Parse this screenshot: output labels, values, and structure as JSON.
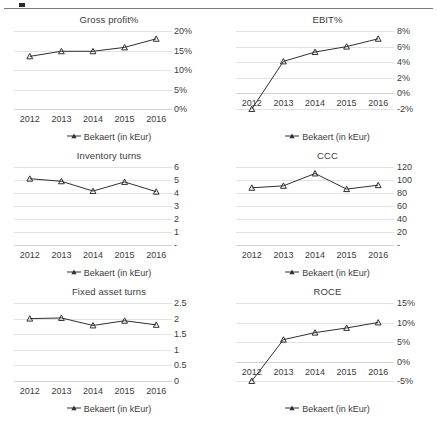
{
  "page": {
    "legend_label": "Bekaert  (in kEur)",
    "series_color": "#2f2f2f",
    "grid_color": "#e2e2e2",
    "text_color": "#3b3b3b"
  },
  "chart_data": [
    {
      "id": "gross-profit",
      "type": "line",
      "title": "Gross profit%",
      "xlabel": "",
      "ylabel": "",
      "categories": [
        "2012",
        "2013",
        "2014",
        "2015",
        "2016"
      ],
      "x": [
        2012,
        2013,
        2014,
        2015,
        2016
      ],
      "yticks": [
        "20%",
        "15%",
        "10%",
        "5%",
        "0%"
      ],
      "ytick_values": [
        20,
        15,
        10,
        5,
        0
      ],
      "ylim": [
        0,
        20
      ],
      "grid": true,
      "legend_position": "bottom-center",
      "series": [
        {
          "name": "Bekaert  (in kEur)",
          "values": [
            13.5,
            14.8,
            14.8,
            15.8,
            18.0
          ]
        }
      ]
    },
    {
      "id": "ebit",
      "type": "line",
      "title": "EBIT%",
      "xlabel": "",
      "ylabel": "",
      "categories": [
        "2012",
        "2013",
        "2014",
        "2015",
        "2016"
      ],
      "x": [
        2012,
        2013,
        2014,
        2015,
        2016
      ],
      "yticks": [
        "8%",
        "6%",
        "4%",
        "2%",
        "0%",
        "-2%"
      ],
      "ytick_values": [
        8,
        6,
        4,
        2,
        0,
        -2
      ],
      "ylim": [
        -2,
        8
      ],
      "grid": true,
      "legend_position": "bottom-center",
      "series": [
        {
          "name": "Bekaert  (in kEur)",
          "values": [
            -2.0,
            4.1,
            5.3,
            6.0,
            7.0
          ]
        }
      ]
    },
    {
      "id": "inventory-turns",
      "type": "line",
      "title": "Inventory turns",
      "xlabel": "",
      "ylabel": "",
      "categories": [
        "2012",
        "2013",
        "2014",
        "2015",
        "2016"
      ],
      "x": [
        2012,
        2013,
        2014,
        2015,
        2016
      ],
      "yticks": [
        "6",
        "5",
        "4",
        "3",
        "2",
        "1",
        "-"
      ],
      "ytick_values": [
        6,
        5,
        4,
        3,
        2,
        1,
        0
      ],
      "ylim": [
        0,
        6
      ],
      "grid": true,
      "legend_position": "bottom-center",
      "series": [
        {
          "name": "Bekaert  (in kEur)",
          "values": [
            5.1,
            4.9,
            4.15,
            4.85,
            4.1
          ]
        }
      ]
    },
    {
      "id": "ccc",
      "type": "line",
      "title": "CCC",
      "xlabel": "",
      "ylabel": "",
      "categories": [
        "2012",
        "2013",
        "2014",
        "2015",
        "2016"
      ],
      "x": [
        2012,
        2013,
        2014,
        2015,
        2016
      ],
      "yticks": [
        "120",
        "100",
        "80",
        "60",
        "40",
        "20",
        "-"
      ],
      "ytick_values": [
        120,
        100,
        80,
        60,
        40,
        20,
        0
      ],
      "ylim": [
        0,
        120
      ],
      "grid": true,
      "legend_position": "bottom-center",
      "series": [
        {
          "name": "Bekaert  (in kEur)",
          "values": [
            88,
            91,
            110,
            86,
            92
          ]
        }
      ]
    },
    {
      "id": "fixed-asset-turns",
      "type": "line",
      "title": "Fixed asset turns",
      "xlabel": "",
      "ylabel": "",
      "categories": [
        "2012",
        "2013",
        "2014",
        "2015",
        "2016"
      ],
      "x": [
        2012,
        2013,
        2014,
        2015,
        2016
      ],
      "yticks": [
        "2.5",
        "2",
        "1.5",
        "1",
        "0.5",
        "0"
      ],
      "ytick_values": [
        2.5,
        2,
        1.5,
        1,
        0.5,
        0
      ],
      "ylim": [
        0,
        2.5
      ],
      "grid": true,
      "legend_position": "bottom-center",
      "series": [
        {
          "name": "Bekaert  (in kEur)",
          "values": [
            2.0,
            2.02,
            1.78,
            1.93,
            1.8
          ]
        }
      ]
    },
    {
      "id": "roce",
      "type": "line",
      "title": "ROCE",
      "xlabel": "",
      "ylabel": "",
      "categories": [
        "2012",
        "2013",
        "2014",
        "2015",
        "2016"
      ],
      "x": [
        2012,
        2013,
        2014,
        2015,
        2016
      ],
      "yticks": [
        "15%",
        "10%",
        "5%",
        "0%",
        "-5%"
      ],
      "ytick_values": [
        15,
        10,
        5,
        0,
        -5
      ],
      "ylim": [
        -5,
        15
      ],
      "grid": true,
      "legend_position": "bottom-center",
      "series": [
        {
          "name": "Bekaert  (in kEur)",
          "values": [
            -5.0,
            5.6,
            7.4,
            8.6,
            10.0
          ]
        }
      ]
    }
  ]
}
